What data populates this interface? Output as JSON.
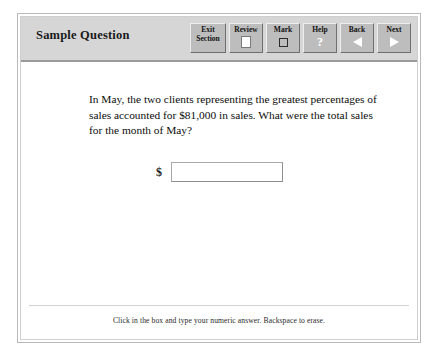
{
  "header": {
    "title": "Sample Question",
    "background_color": "#d6d6d6"
  },
  "toolbar": {
    "buttons": [
      {
        "label_line1": "Exit",
        "label_line2": "Section",
        "icon": "none"
      },
      {
        "label_line1": "Review",
        "label_line2": "",
        "icon": "page-icon"
      },
      {
        "label_line1": "Mark",
        "label_line2": "",
        "icon": "checkbox-icon"
      },
      {
        "label_line1": "Help",
        "label_line2": "",
        "icon": "question-mark-icon"
      },
      {
        "label_line1": "Back",
        "label_line2": "",
        "icon": "triangle-left-icon"
      },
      {
        "label_line1": "Next",
        "label_line2": "",
        "icon": "triangle-right-icon"
      }
    ]
  },
  "question": {
    "text": "In May, the two clients representing the greatest percentages of sales accounted for $81,000 in sales. What were the total sales for the month of May?"
  },
  "answer": {
    "currency_symbol": "$",
    "value": "",
    "placeholder": ""
  },
  "footer": {
    "instruction": "Click in the box and type your numeric answer. Backspace to erase."
  }
}
